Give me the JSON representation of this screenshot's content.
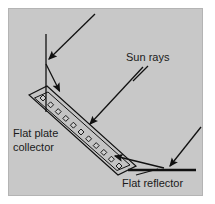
{
  "figure": {
    "background_color": "#ffffff",
    "panel_color": "#c8c8c8",
    "panel_border_color": "#b4b4b4",
    "ink_color": "#111111",
    "panel": {
      "x": 8,
      "y": 8,
      "width": 195,
      "height": 188
    }
  },
  "labels": {
    "sun_rays": "Sun rays",
    "flat_plate_line1": "Flat plate",
    "flat_plate_line2": "collector",
    "flat_reflector": "Flat reflector"
  },
  "label_positions": {
    "sun_rays": {
      "x": 126,
      "y": 61
    },
    "flat_plate_line1": {
      "x": 13,
      "y": 137
    },
    "flat_plate_line2": {
      "x": 13,
      "y": 151
    },
    "flat_reflector": {
      "x": 122,
      "y": 187
    }
  },
  "components": {
    "collector": {
      "name": "flat-plate-collector",
      "outline": "29,95 47,86 136,166 118,175",
      "inner_outline": "34,98 48,91 131,165 117,171",
      "tube_count": 11,
      "tube_start": {
        "x": 43,
        "y": 98
      },
      "tube_end": {
        "x": 119,
        "y": 166
      },
      "tube_size": 4.2
    },
    "reflector": {
      "name": "flat-reflector",
      "x1": 128,
      "y1": 170,
      "x2": 196,
      "y2": 170,
      "stroke_width": 2.6
    }
  },
  "rays": [
    {
      "name": "incident-ray-upper-left",
      "description": "sun ray arriving from upper right onto collector top region",
      "x1": 95,
      "y1": 14,
      "x2": 46,
      "y2": 62,
      "arrow_at_end": true
    },
    {
      "name": "normal-line-vertical",
      "description": "vertical reference line through the incidence point",
      "x1": 46,
      "y1": 34,
      "x2": 46,
      "y2": 112,
      "arrow_at_end": false
    },
    {
      "name": "reflected-ray-to-collector-upper",
      "description": "ray from incidence point down to collector surface",
      "x1": 46,
      "y1": 64,
      "x2": 61,
      "y2": 95,
      "arrow_at_end": true
    },
    {
      "name": "incident-ray-middle",
      "description": "sun ray from upper right striking collector mid surface",
      "x1": 143,
      "y1": 67,
      "x2": 88,
      "y2": 128,
      "arrow_at_end": true
    },
    {
      "name": "reflected-ray-from-reflector",
      "description": "ray reflected off the flat reflector up to the collector lower end",
      "x1": 164,
      "y1": 168,
      "x2": 111,
      "y2": 155,
      "arrow_at_end": true
    },
    {
      "name": "incident-ray-right",
      "description": "sun ray from upper right onto the flat reflector",
      "x1": 201,
      "y1": 127,
      "x2": 168,
      "y2": 169,
      "arrow_at_end": true
    }
  ],
  "leaders": [
    {
      "name": "sun-rays-leader",
      "x1": 148,
      "y1": 66,
      "x2": 132,
      "y2": 82
    },
    {
      "name": "flat-reflector-leader",
      "x1": 134,
      "y1": 176,
      "x2": 160,
      "y2": 169
    }
  ]
}
